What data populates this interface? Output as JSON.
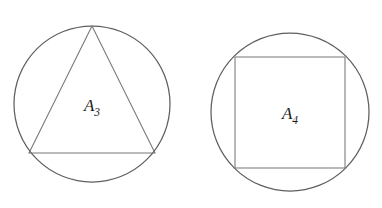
{
  "figure": {
    "background_color": "#ffffff",
    "stroke_color": "#6a6a6a",
    "circle_stroke_color": "#5f5f5f",
    "polygon_stroke_color": "#777777",
    "label_color": "#1b1b1b",
    "width": 382,
    "height": 208,
    "panels": [
      {
        "id": "panel-triangle",
        "shape_name": "equilateral-triangle-inscribed-in-circle",
        "label_base": "A",
        "label_subscript": "3",
        "label_full": "A3",
        "label_x": 92,
        "label_y": 111,
        "circle": {
          "cx": 92,
          "cy": 104,
          "r": 78
        },
        "polygon_points": "92,26 155,153 29,153",
        "sides": 3
      },
      {
        "id": "panel-square",
        "shape_name": "square-inscribed-in-circle",
        "label_base": "A",
        "label_subscript": "4",
        "label_full": "A4",
        "label_x": 290,
        "label_y": 119,
        "circle": {
          "cx": 290,
          "cy": 112,
          "r": 79
        },
        "polygon_points": "235,57 345,57 345,168 235,168",
        "sides": 4
      }
    ]
  }
}
